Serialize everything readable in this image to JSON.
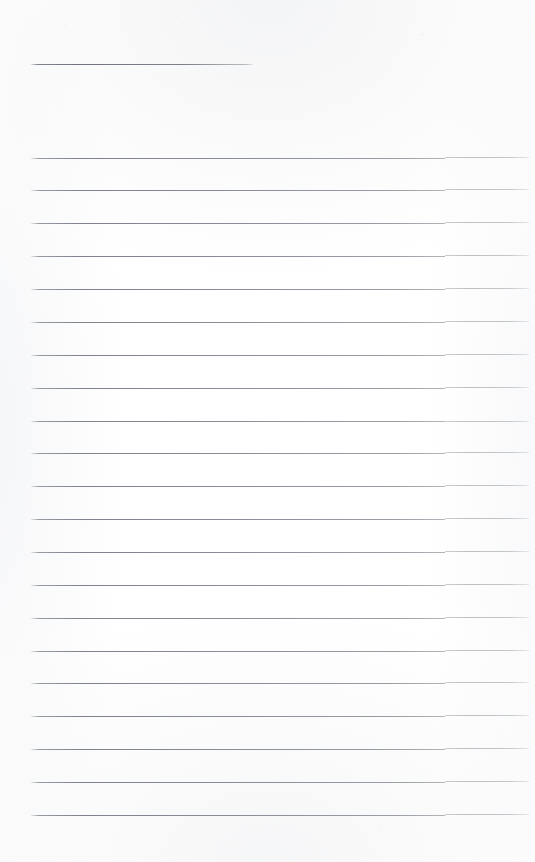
{
  "document": {
    "kind": "scanned-ruled-page",
    "description": "Blank scanned ruled notebook page",
    "page_width": 535,
    "page_height": 862,
    "background_color": "#fefefe",
    "paper_tint": "#f7f8f9",
    "rule_color": "#7a7e88",
    "rule_color_right_segment": "#9aa0a8",
    "content_text": "",
    "visible_text": "",
    "margin_left": 31,
    "margin_right": 529,
    "fold_step_x": 445,
    "rule_count": 22,
    "rule_spacing": 32.8
  },
  "rules": [
    {
      "id": "rule-01",
      "y": 64,
      "x_start": 31,
      "x_end": 253,
      "full_width": false,
      "stepped": false,
      "step_offset": 0
    },
    {
      "id": "rule-02",
      "y": 158,
      "x_start": 31,
      "x_end": 529,
      "full_width": true,
      "stepped": true,
      "step_offset": -1
    },
    {
      "id": "rule-03",
      "y": 190,
      "x_start": 31,
      "x_end": 529,
      "full_width": true,
      "stepped": true,
      "step_offset": -1
    },
    {
      "id": "rule-04",
      "y": 223,
      "x_start": 31,
      "x_end": 529,
      "full_width": true,
      "stepped": true,
      "step_offset": -1
    },
    {
      "id": "rule-05",
      "y": 256,
      "x_start": 31,
      "x_end": 529,
      "full_width": true,
      "stepped": true,
      "step_offset": -1
    },
    {
      "id": "rule-06",
      "y": 289,
      "x_start": 31,
      "x_end": 529,
      "full_width": true,
      "stepped": true,
      "step_offset": -1
    },
    {
      "id": "rule-07",
      "y": 322,
      "x_start": 31,
      "x_end": 529,
      "full_width": true,
      "stepped": true,
      "step_offset": -1
    },
    {
      "id": "rule-08",
      "y": 355,
      "x_start": 31,
      "x_end": 529,
      "full_width": true,
      "stepped": true,
      "step_offset": -1
    },
    {
      "id": "rule-09",
      "y": 388,
      "x_start": 31,
      "x_end": 529,
      "full_width": true,
      "stepped": true,
      "step_offset": -1
    },
    {
      "id": "rule-10",
      "y": 421,
      "x_start": 31,
      "x_end": 529,
      "full_width": true,
      "stepped": true,
      "step_offset": 0
    },
    {
      "id": "rule-11",
      "y": 453,
      "x_start": 31,
      "x_end": 529,
      "full_width": true,
      "stepped": true,
      "step_offset": -1
    },
    {
      "id": "rule-12",
      "y": 486,
      "x_start": 31,
      "x_end": 529,
      "full_width": true,
      "stepped": true,
      "step_offset": -1
    },
    {
      "id": "rule-13",
      "y": 519,
      "x_start": 31,
      "x_end": 529,
      "full_width": true,
      "stepped": true,
      "step_offset": -1
    },
    {
      "id": "rule-14",
      "y": 552,
      "x_start": 31,
      "x_end": 529,
      "full_width": true,
      "stepped": true,
      "step_offset": -1
    },
    {
      "id": "rule-15",
      "y": 585,
      "x_start": 31,
      "x_end": 529,
      "full_width": true,
      "stepped": true,
      "step_offset": -1
    },
    {
      "id": "rule-16",
      "y": 618,
      "x_start": 31,
      "x_end": 529,
      "full_width": true,
      "stepped": true,
      "step_offset": -1
    },
    {
      "id": "rule-17",
      "y": 651,
      "x_start": 31,
      "x_end": 529,
      "full_width": true,
      "stepped": true,
      "step_offset": -1
    },
    {
      "id": "rule-18",
      "y": 683,
      "x_start": 31,
      "x_end": 529,
      "full_width": true,
      "stepped": true,
      "step_offset": -1
    },
    {
      "id": "rule-19",
      "y": 716,
      "x_start": 31,
      "x_end": 529,
      "full_width": true,
      "stepped": true,
      "step_offset": -1
    },
    {
      "id": "rule-20",
      "y": 749,
      "x_start": 31,
      "x_end": 529,
      "full_width": true,
      "stepped": true,
      "step_offset": -1
    },
    {
      "id": "rule-21",
      "y": 782,
      "x_start": 31,
      "x_end": 529,
      "full_width": true,
      "stepped": true,
      "step_offset": -1
    },
    {
      "id": "rule-22",
      "y": 815,
      "x_start": 31,
      "x_end": 529,
      "full_width": true,
      "stepped": true,
      "step_offset": -1
    }
  ]
}
